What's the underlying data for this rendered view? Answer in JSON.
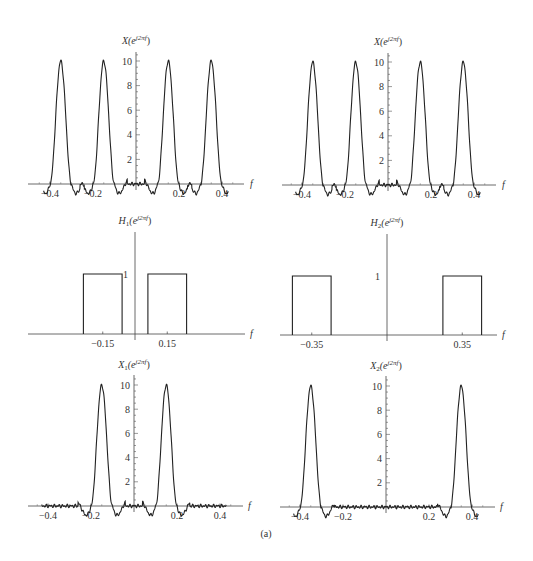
{
  "figure": {
    "caption": "(a)"
  },
  "chart_data": [
    {
      "id": "X-top-left",
      "type": "line",
      "title": "X(e^{j2πf})",
      "title_main": "X(e",
      "title_sup": "j2πf",
      "title_end": ")",
      "xlabel": "f",
      "xlim": [
        -0.45,
        0.45
      ],
      "ylim": [
        0,
        10.5
      ],
      "xticks": [
        -0.4,
        -0.2,
        0.2,
        0.4
      ],
      "xtick_labels": [
        "-0.4",
        "-0.2",
        "0.2",
        "0.4"
      ],
      "yticks": [
        2,
        4,
        6,
        8,
        10
      ],
      "ytick_labels": [
        "2",
        "4",
        "6",
        "8",
        "10"
      ],
      "peaks": [
        {
          "center": -0.35,
          "height": 10
        },
        {
          "center": -0.15,
          "height": 10
        },
        {
          "center": 0.15,
          "height": 10
        },
        {
          "center": 0.35,
          "height": 10
        }
      ],
      "peak_halfwidth": 0.05,
      "layout": {
        "axisX": 136,
        "baseY": 184,
        "pxPerUnitX": 215,
        "pxPerUnitY": 12.3,
        "x0": 28,
        "x1": 244,
        "yTop": 52,
        "titleX": 136,
        "titleY": 44,
        "fLabelX": 250
      }
    },
    {
      "id": "X-top-right",
      "type": "line",
      "title": "X(e^{j2πf})",
      "title_main": "X(e",
      "title_sup": "j2πf",
      "title_end": ")",
      "xlabel": "f",
      "xlim": [
        -0.45,
        0.45
      ],
      "ylim": [
        0,
        10.5
      ],
      "xticks": [
        -0.4,
        -0.2,
        0.2,
        0.4
      ],
      "xtick_labels": [
        "-0.4",
        "-0.2",
        "0.2",
        "0.4"
      ],
      "yticks": [
        2,
        4,
        6,
        8,
        10
      ],
      "ytick_labels": [
        "2",
        "4",
        "6",
        "8",
        "10"
      ],
      "peaks": [
        {
          "center": -0.35,
          "height": 10
        },
        {
          "center": -0.15,
          "height": 10
        },
        {
          "center": 0.15,
          "height": 10
        },
        {
          "center": 0.35,
          "height": 10
        }
      ],
      "peak_halfwidth": 0.05,
      "layout": {
        "axisX": 388,
        "baseY": 185,
        "pxPerUnitX": 215,
        "pxPerUnitY": 12.3,
        "x0": 282,
        "x1": 496,
        "yTop": 53,
        "titleX": 388,
        "titleY": 45,
        "fLabelX": 502
      }
    },
    {
      "id": "H1-middle-left",
      "type": "line",
      "title": "H_1(e^{j2πf})",
      "title_main": "H",
      "title_sub": "1",
      "title_rest": "(e",
      "title_sup": "j2πf",
      "title_end": ")",
      "xlabel": "f",
      "ylim": [
        0,
        1.3
      ],
      "xticks": [
        -0.15,
        0.15
      ],
      "xtick_labels": [
        "-0.15",
        "0.15"
      ],
      "yticks": [
        1
      ],
      "ytick_labels": [
        "1"
      ],
      "passbands": [
        {
          "center": -0.15,
          "low": -0.24,
          "high": -0.06,
          "gain": 1
        },
        {
          "center": 0.15,
          "low": 0.06,
          "high": 0.24,
          "gain": 1
        }
      ],
      "layout": {
        "axisX": 135,
        "baseY": 334,
        "pxPerUnitX": 215,
        "pxPerUnitY": 60,
        "x0": 28,
        "x1": 245,
        "yTop": 232,
        "titleX": 135,
        "titleY": 224,
        "fLabelX": 250
      }
    },
    {
      "id": "H2-middle-right",
      "type": "line",
      "title": "H_2(e^{j2πf})",
      "title_main": "H",
      "title_sub": "2",
      "title_rest": "(e",
      "title_sup": "j2πf",
      "title_end": ")",
      "xlabel": "f",
      "ylim": [
        0,
        1.3
      ],
      "xticks": [
        -0.35,
        0.35
      ],
      "xtick_labels": [
        "-0.35",
        "0.35"
      ],
      "yticks": [
        1
      ],
      "ytick_labels": [
        "1"
      ],
      "passbands": [
        {
          "center": -0.35,
          "low": -0.44,
          "high": -0.26,
          "gain": 1
        },
        {
          "center": 0.35,
          "low": 0.26,
          "high": 0.44,
          "gain": 1
        }
      ],
      "layout": {
        "axisX": 387,
        "baseY": 335,
        "pxPerUnitX": 215,
        "pxPerUnitY": 59,
        "x0": 280,
        "x1": 497,
        "yTop": 234,
        "titleX": 387,
        "titleY": 226,
        "fLabelX": 502
      }
    },
    {
      "id": "X1-bottom-left",
      "type": "line",
      "title": "X_1(e^{j2πf})",
      "title_main": "X",
      "title_sub": "1",
      "title_rest": "(e",
      "title_sup": "j2πf",
      "title_end": ")",
      "xlabel": "f",
      "xlim": [
        -0.45,
        0.45
      ],
      "ylim": [
        0,
        10.5
      ],
      "xticks": [
        -0.4,
        -0.2,
        0.2,
        0.4
      ],
      "xtick_labels": [
        "-0.4",
        "-0.2",
        "0.2",
        "0.4"
      ],
      "yticks": [
        2,
        4,
        6,
        8,
        10
      ],
      "ytick_labels": [
        "2",
        "4",
        "6",
        "8",
        "10"
      ],
      "peaks": [
        {
          "center": -0.15,
          "height": 10
        },
        {
          "center": 0.15,
          "height": 10
        }
      ],
      "peak_halfwidth": 0.05,
      "layout": {
        "axisX": 134,
        "baseY": 506,
        "pxPerUnitX": 215,
        "pxPerUnitY": 12.1,
        "x0": 28,
        "x1": 243,
        "yTop": 375,
        "titleX": 134,
        "titleY": 368,
        "fLabelX": 248
      }
    },
    {
      "id": "X2-bottom-right",
      "type": "line",
      "title": "X_2(e^{j2πf})",
      "title_main": "X",
      "title_sub": "2",
      "title_rest": "(e",
      "title_sup": "j2πf",
      "title_end": ")",
      "xlabel": "f",
      "xlim": [
        -0.45,
        0.45
      ],
      "ylim": [
        0,
        10.5
      ],
      "xticks": [
        -0.4,
        -0.2,
        0.2,
        0.4
      ],
      "xtick_labels": [
        "-0.4",
        "-0.2",
        "0.2",
        "0.4"
      ],
      "yticks": [
        2,
        4,
        6,
        8,
        10
      ],
      "ytick_labels": [
        "2",
        "4",
        "6",
        "8",
        "10"
      ],
      "peaks": [
        {
          "center": -0.35,
          "height": 10
        },
        {
          "center": 0.35,
          "height": 10
        }
      ],
      "peak_halfwidth": 0.05,
      "layout": {
        "axisX": 386,
        "baseY": 507,
        "pxPerUnitX": 215,
        "pxPerUnitY": 12.1,
        "x0": 280,
        "x1": 495,
        "yTop": 376,
        "titleX": 386,
        "titleY": 369,
        "fLabelX": 500
      }
    }
  ]
}
